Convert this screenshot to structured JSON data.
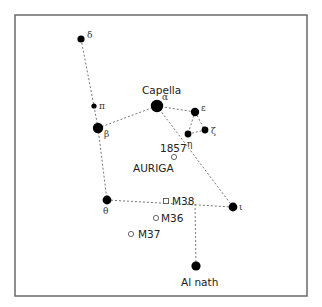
{
  "diagram": {
    "title": "AURIGA",
    "frame": {
      "x": 15,
      "y": 15,
      "w": 292,
      "h": 281
    },
    "stars": [
      {
        "id": "delta",
        "greek": "δ",
        "name": "",
        "x": 81,
        "y": 39,
        "r": 3.6,
        "lx": 87,
        "ly": 38
      },
      {
        "id": "pi",
        "greek": "π",
        "name": "",
        "x": 94,
        "y": 106,
        "r": 2.6,
        "lx": 99,
        "ly": 109
      },
      {
        "id": "beta",
        "greek": "β",
        "name": "",
        "x": 98,
        "y": 128,
        "r": 5.2,
        "lx": 104,
        "ly": 137
      },
      {
        "id": "alpha",
        "greek": "α",
        "name": "Capella",
        "x": 157,
        "y": 106,
        "r": 6.2,
        "lx": 162,
        "ly": 100
      },
      {
        "id": "epsilon",
        "greek": "ε",
        "name": "",
        "x": 195,
        "y": 112,
        "r": 4.2,
        "lx": 201,
        "ly": 111
      },
      {
        "id": "zeta",
        "greek": "ζ",
        "name": "",
        "x": 205,
        "y": 130,
        "r": 3.4,
        "lx": 211,
        "ly": 134
      },
      {
        "id": "eta",
        "greek": "η",
        "name": "",
        "x": 188,
        "y": 134,
        "r": 3.4,
        "lx": 187,
        "ly": 147
      },
      {
        "id": "theta",
        "greek": "θ",
        "name": "",
        "x": 107,
        "y": 200,
        "r": 4.4,
        "lx": 103,
        "ly": 214
      },
      {
        "id": "iota",
        "greek": "ι",
        "name": "",
        "x": 233,
        "y": 207,
        "r": 4.4,
        "lx": 239,
        "ly": 210
      },
      {
        "id": "alnath",
        "greek": "",
        "name": "Al nath",
        "x": 196,
        "y": 266,
        "r": 4.6,
        "lx": 181,
        "ly": 286
      }
    ],
    "star_labels": {
      "capella": {
        "text": "Capella",
        "x": 142,
        "y": 94
      },
      "alnath": {
        "text": "Al nath",
        "x": 181,
        "y": 286
      }
    },
    "links": [
      [
        81,
        39,
        94,
        106
      ],
      [
        94,
        106,
        98,
        128
      ],
      [
        98,
        128,
        107,
        200
      ],
      [
        98,
        128,
        157,
        106
      ],
      [
        157,
        106,
        195,
        112
      ],
      [
        195,
        112,
        188,
        134
      ],
      [
        195,
        112,
        205,
        130
      ],
      [
        188,
        134,
        205,
        130
      ],
      [
        157,
        106,
        233,
        207
      ],
      [
        107,
        200,
        233,
        207
      ],
      [
        195,
        204,
        196,
        266
      ]
    ],
    "objects": [
      {
        "id": "nova-1857",
        "label": "1857",
        "shape": "circle",
        "x": 174,
        "y": 157,
        "lx": 160,
        "ly": 152
      },
      {
        "id": "m38",
        "label": "M38",
        "shape": "square",
        "x": 166,
        "y": 201,
        "lx": 172,
        "ly": 205
      },
      {
        "id": "m36",
        "label": "M36",
        "shape": "circle",
        "x": 156,
        "y": 218,
        "lx": 161,
        "ly": 222
      },
      {
        "id": "m37",
        "label": "M37",
        "shape": "circle",
        "x": 131,
        "y": 234,
        "lx": 138,
        "ly": 238
      }
    ],
    "constellation_label": {
      "text": "AURIGA",
      "x": 133,
      "y": 172
    },
    "colors": {
      "star": "#000000",
      "line": "#777777",
      "frame": "#6a6a6a",
      "text": "#222222"
    }
  }
}
